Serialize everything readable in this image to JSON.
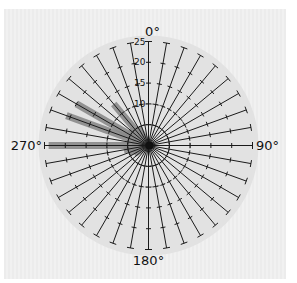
{
  "chart_data": {
    "type": "polar-bar",
    "title": "",
    "radial_axis": {
      "min": 0,
      "max": 25,
      "ticks": [
        5,
        10,
        15,
        20,
        25
      ],
      "tick_labels": [
        "10",
        "15",
        "20",
        "25"
      ],
      "dashed_circles": [
        5,
        10
      ]
    },
    "angular_axis": {
      "step_deg": 10,
      "direction": "clockwise",
      "zero": "top",
      "labels": [
        {
          "angle": 0,
          "text": "0°"
        },
        {
          "angle": 90,
          "text": "90°"
        },
        {
          "angle": 180,
          "text": "180°"
        },
        {
          "angle": 270,
          "text": "270°"
        }
      ]
    },
    "series": [
      {
        "name": "frequency",
        "angles": [
          240,
          250,
          260,
          270,
          280,
          290,
          300,
          310,
          320,
          330
        ],
        "values": [
          4,
          5,
          6,
          24,
          4,
          21,
          20,
          6,
          13,
          5
        ]
      }
    ],
    "colors": {
      "bar": "#8a8a8a",
      "spoke": "#1a1a1a",
      "disk": "#e2e2e2",
      "panel": "#eeeeee"
    }
  }
}
